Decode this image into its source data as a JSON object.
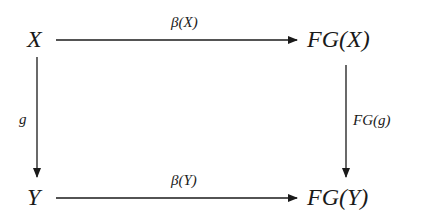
{
  "diagram": {
    "type": "commutative-square",
    "nodes": {
      "top_left": "X",
      "top_right": "FG(X)",
      "bottom_left": "Y",
      "bottom_right": "FG(Y)"
    },
    "arrows": {
      "top": {
        "from": "X",
        "to": "FG(X)",
        "label": "β(X)"
      },
      "bottom": {
        "from": "Y",
        "to": "FG(Y)",
        "label": "β(Y)"
      },
      "left": {
        "from": "X",
        "to": "Y",
        "label": "g"
      },
      "right": {
        "from": "FG(X)",
        "to": "FG(Y)",
        "label": "FG(g)"
      }
    },
    "colors": {
      "ink": "#1a1a1a",
      "background": "#ffffff"
    }
  }
}
